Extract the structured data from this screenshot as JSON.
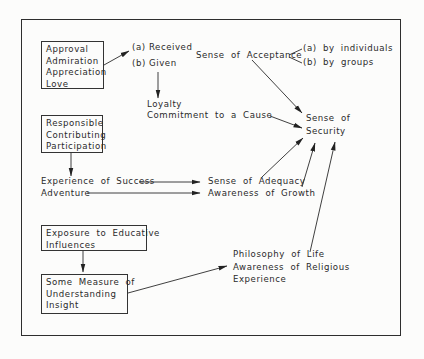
{
  "diagram": {
    "title": "",
    "boxes": {
      "approval": {
        "lines": [
          "Approval",
          "Admiration",
          "Appreciation",
          "Love"
        ]
      },
      "responsible": {
        "lines": [
          "Responsible",
          "Contributing",
          "Participation"
        ]
      },
      "exposure": {
        "lines": [
          "Exposure to Educative",
          "Influences"
        ]
      },
      "understanding": {
        "lines": [
          "Some Measure of",
          "Understanding",
          "Insight"
        ]
      }
    },
    "labels": {
      "received": "(a)  Received",
      "given": "(b)  Given",
      "loyalty": "Loyalty",
      "commitment": "Commitment to a Cause",
      "acceptance": "Sense of Acceptance",
      "by_individuals": "(a) by individuals",
      "by_groups": "(b) by groups",
      "security_line1": "Sense of",
      "security_line2": "Security",
      "experience_success": "Experience of Success",
      "adventure": "Adventure",
      "adequacy": "Sense of Adequacy",
      "growth": "Awareness of Growth",
      "philosophy": "Philosophy of Life",
      "religious": "Awareness of Religious",
      "experience": "Experience"
    },
    "edges": [
      {
        "from": "approval-box",
        "to": "received",
        "type": "arrow"
      },
      {
        "from": "given",
        "to": "loyalty",
        "type": "arrow"
      },
      {
        "from": "commitment",
        "to": "sense-of-security",
        "type": "arrow"
      },
      {
        "from": "sense-of-acceptance",
        "to": "sense-of-security",
        "type": "arrow"
      },
      {
        "from": "sense-of-acceptance",
        "to": "by-individuals",
        "type": "line"
      },
      {
        "from": "sense-of-acceptance",
        "to": "by-groups",
        "type": "line"
      },
      {
        "from": "responsible-box",
        "to": "experience-of-success",
        "type": "arrow"
      },
      {
        "from": "experience-of-success",
        "to": "sense-of-adequacy",
        "type": "arrow"
      },
      {
        "from": "adventure",
        "to": "awareness-of-growth",
        "type": "arrow"
      },
      {
        "from": "sense-of-adequacy",
        "to": "sense-of-security",
        "type": "arrow"
      },
      {
        "from": "awareness-of-growth",
        "to": "sense-of-security",
        "type": "arrow"
      },
      {
        "from": "philosophy-of-life",
        "to": "sense-of-security",
        "type": "arrow"
      },
      {
        "from": "exposure-box",
        "to": "understanding-box",
        "type": "arrow"
      },
      {
        "from": "understanding-box",
        "to": "philosophy-of-life",
        "type": "arrow"
      }
    ],
    "colors": {
      "ink": "#2a2a2a",
      "paper": "#fcfcfb"
    }
  }
}
